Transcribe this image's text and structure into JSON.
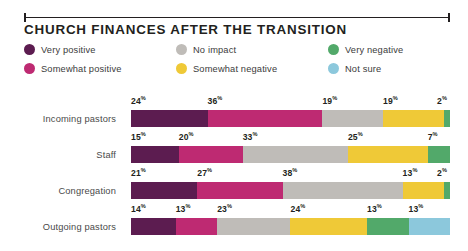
{
  "header": {
    "title": "CHURCH FINANCES AFTER THE TRANSITION",
    "rule_icon": "horizontal-rule-with-end-caps"
  },
  "legend": {
    "items": [
      {
        "label": "Very positive",
        "color": "#5C1C50",
        "icon": "circle-swatch-icon"
      },
      {
        "label": "Somewhat positive",
        "color": "#BE2A72",
        "icon": "circle-swatch-icon"
      },
      {
        "label": "No impact",
        "color": "#BFBCB8",
        "icon": "circle-swatch-icon"
      },
      {
        "label": "Somewhat negative",
        "color": "#EFC937",
        "icon": "circle-swatch-icon"
      },
      {
        "label": "Very negative",
        "color": "#52A96A",
        "icon": "circle-swatch-icon"
      },
      {
        "label": "Not sure",
        "color": "#8CC8DC",
        "icon": "circle-swatch-icon"
      }
    ]
  },
  "chart_data": {
    "type": "bar",
    "orientation": "horizontal",
    "stacked": true,
    "title": "CHURCH FINANCES AFTER THE TRANSITION",
    "xlabel": "",
    "ylabel": "",
    "xlim": [
      0,
      100
    ],
    "grid": false,
    "legend_position": "top",
    "unit": "%",
    "categories": [
      "Incoming pastors",
      "Staff",
      "Congregation",
      "Outgoing pastors"
    ],
    "series": [
      {
        "name": "Very positive",
        "color": "#5C1C50",
        "values": [
          24,
          15,
          21,
          14
        ]
      },
      {
        "name": "Somewhat positive",
        "color": "#BE2A72",
        "values": [
          36,
          20,
          27,
          13
        ]
      },
      {
        "name": "No impact",
        "color": "#BFBCB8",
        "values": [
          19,
          33,
          38,
          23
        ]
      },
      {
        "name": "Somewhat negative",
        "color": "#EFC937",
        "values": [
          19,
          25,
          13,
          24
        ]
      },
      {
        "name": "Very negative",
        "color": "#52A96A",
        "values": [
          2,
          7,
          2,
          13
        ]
      },
      {
        "name": "Not sure",
        "color": "#8CC8DC",
        "values": [
          0,
          0,
          0,
          13
        ]
      }
    ],
    "rows": [
      {
        "category": "Incoming pastors",
        "segments": [
          {
            "series": "Very positive",
            "value": 24,
            "label": "24",
            "suffix": "%",
            "color": "#5C1C50",
            "show_label": true
          },
          {
            "series": "Somewhat positive",
            "value": 36,
            "label": "36",
            "suffix": "%",
            "color": "#BE2A72",
            "show_label": true
          },
          {
            "series": "No impact",
            "value": 19,
            "label": "19",
            "suffix": "%",
            "color": "#BFBCB8",
            "show_label": true
          },
          {
            "series": "Somewhat negative",
            "value": 19,
            "label": "19",
            "suffix": "%",
            "color": "#EFC937",
            "show_label": true
          },
          {
            "series": "Very negative",
            "value": 2,
            "label": "2",
            "suffix": "%",
            "color": "#52A96A",
            "show_label": true
          }
        ]
      },
      {
        "category": "Staff",
        "segments": [
          {
            "series": "Very positive",
            "value": 15,
            "label": "15",
            "suffix": "%",
            "color": "#5C1C50",
            "show_label": true
          },
          {
            "series": "Somewhat positive",
            "value": 20,
            "label": "20",
            "suffix": "%",
            "color": "#BE2A72",
            "show_label": true
          },
          {
            "series": "No impact",
            "value": 33,
            "label": "33",
            "suffix": "%",
            "color": "#BFBCB8",
            "show_label": true
          },
          {
            "series": "Somewhat negative",
            "value": 25,
            "label": "25",
            "suffix": "%",
            "color": "#EFC937",
            "show_label": true
          },
          {
            "series": "Very negative",
            "value": 7,
            "label": "7",
            "suffix": "%",
            "color": "#52A96A",
            "show_label": true
          }
        ]
      },
      {
        "category": "Congregation",
        "segments": [
          {
            "series": "Very positive",
            "value": 21,
            "label": "21",
            "suffix": "%",
            "color": "#5C1C50",
            "show_label": true
          },
          {
            "series": "Somewhat positive",
            "value": 27,
            "label": "27",
            "suffix": "%",
            "color": "#BE2A72",
            "show_label": true
          },
          {
            "series": "No impact",
            "value": 38,
            "label": "38",
            "suffix": "%",
            "color": "#BFBCB8",
            "show_label": true
          },
          {
            "series": "Somewhat negative",
            "value": 13,
            "label": "13",
            "suffix": "%",
            "color": "#EFC937",
            "show_label": true
          },
          {
            "series": "Very negative",
            "value": 2,
            "label": "2",
            "suffix": "%",
            "color": "#52A96A",
            "show_label": true
          }
        ]
      },
      {
        "category": "Outgoing pastors",
        "segments": [
          {
            "series": "Very positive",
            "value": 14,
            "label": "14",
            "suffix": "%",
            "color": "#5C1C50",
            "show_label": true
          },
          {
            "series": "Somewhat positive",
            "value": 13,
            "label": "13",
            "suffix": "%",
            "color": "#BE2A72",
            "show_label": true
          },
          {
            "series": "No impact",
            "value": 23,
            "label": "23",
            "suffix": "%",
            "color": "#BFBCB8",
            "show_label": true
          },
          {
            "series": "Somewhat negative",
            "value": 24,
            "label": "24",
            "suffix": "%",
            "color": "#EFC937",
            "show_label": true
          },
          {
            "series": "Very negative",
            "value": 13,
            "label": "13",
            "suffix": "%",
            "color": "#52A96A",
            "show_label": true
          },
          {
            "series": "Not sure",
            "value": 13,
            "label": "13",
            "suffix": "%",
            "color": "#8CC8DC",
            "show_label": true
          }
        ]
      }
    ]
  }
}
